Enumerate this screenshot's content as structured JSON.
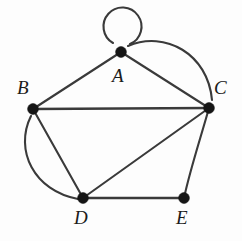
{
  "figure": {
    "name": "undirected-graph-diagram",
    "width": 242,
    "height": 241,
    "background_color": "#fdfdfd",
    "edge_color": "#3a3a3a",
    "vertex_color": "#151515",
    "label_color": "#1b1b1b"
  },
  "chart_data": {
    "type": "diagram",
    "subtype": "undirected-multigraph",
    "title": "",
    "vertices": [
      {
        "id": "A",
        "label": "A",
        "x": 121,
        "y": 52,
        "label_x": 112,
        "label_y": 66,
        "degree": 6
      },
      {
        "id": "B",
        "label": "B",
        "x": 33,
        "y": 109,
        "label_x": 17,
        "label_y": 78,
        "degree": 4
      },
      {
        "id": "C",
        "label": "C",
        "x": 209,
        "y": 108,
        "label_x": 214,
        "label_y": 78,
        "degree": 5
      },
      {
        "id": "D",
        "label": "D",
        "x": 83,
        "y": 198,
        "label_x": 74,
        "label_y": 208,
        "degree": 5
      },
      {
        "id": "E",
        "label": "E",
        "x": 184,
        "y": 198,
        "label_x": 176,
        "label_y": 208,
        "degree": 2
      }
    ],
    "edges": [
      {
        "id": "loop-A",
        "from": "A",
        "to": "A",
        "style": "self-loop",
        "path": "M 113 43 A 19 19 0 1 1 130 44"
      },
      {
        "id": "edge-A-B",
        "from": "A",
        "to": "B",
        "style": "straight",
        "path": "M 121 52 L 33 109"
      },
      {
        "id": "edge-A-C-1",
        "from": "A",
        "to": "C",
        "style": "straight",
        "path": "M 121 52 L 209 108"
      },
      {
        "id": "edge-A-C-2",
        "from": "A",
        "to": "C",
        "style": "curved",
        "path": "M 128 46 C 165 30 208 54 212 100"
      },
      {
        "id": "edge-B-C",
        "from": "B",
        "to": "C",
        "style": "straight",
        "path": "M 33 109 L 209 108"
      },
      {
        "id": "edge-B-D-1",
        "from": "B",
        "to": "D",
        "style": "straight",
        "path": "M 33 109 L 83 198"
      },
      {
        "id": "edge-B-D-2",
        "from": "B",
        "to": "D",
        "style": "curved",
        "path": "M 31 116 C 14 150 34 191 78 199"
      },
      {
        "id": "edge-C-D",
        "from": "C",
        "to": "D",
        "style": "straight",
        "path": "M 209 108 L 83 198"
      },
      {
        "id": "edge-C-E",
        "from": "C",
        "to": "E",
        "style": "straight",
        "path": "M 209 108 C 200 140 190 170 184 198"
      },
      {
        "id": "edge-D-E",
        "from": "D",
        "to": "E",
        "style": "straight",
        "path": "M 83 198 L 184 198"
      }
    ],
    "edge_list_text": [
      "A-A",
      "A-B",
      "A-C",
      "A-C",
      "B-C",
      "B-D",
      "B-D",
      "C-D",
      "C-E",
      "D-E"
    ],
    "vertex_count": 5,
    "edge_count": 10
  }
}
